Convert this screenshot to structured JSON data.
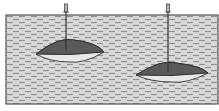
{
  "diagram": {
    "colors": {
      "background": "#ffffff",
      "layer_fill": "#d6d6d6",
      "layer_dash": "#8a8a8a",
      "layer_border": "#555555",
      "lens_upper": "#5a5a5a",
      "lens_lower": "#e8e8e8",
      "well": "#333333"
    },
    "layer": {
      "x": 6,
      "y": 15,
      "width": 212,
      "height": 89
    },
    "lenses": [
      {
        "name": "left-reservoir",
        "cx": 70,
        "cy": 52,
        "half_width": 34,
        "top": 40,
        "bottom": 62,
        "contact_y": 54
      },
      {
        "name": "right-reservoir",
        "cx": 172,
        "cy": 74,
        "half_width": 36,
        "top": 63,
        "bottom": 82,
        "contact_y": 75
      }
    ],
    "wells": [
      {
        "name": "left-well",
        "x": 66,
        "top": 4,
        "bottom": 50
      },
      {
        "name": "right-well",
        "x": 168,
        "top": 4,
        "bottom": 72
      }
    ]
  }
}
